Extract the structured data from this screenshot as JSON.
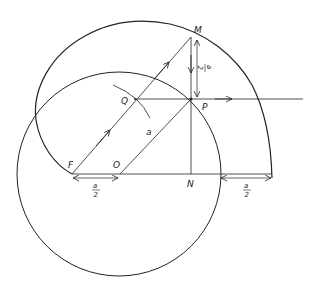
{
  "diagram": {
    "points": {
      "M": "M",
      "P": "P",
      "Q": "Q",
      "F": "F",
      "O": "O",
      "N": "N"
    },
    "labels": {
      "radius": "a",
      "half_num": "a",
      "half_den": "2"
    },
    "colors": {
      "stroke": "#222222",
      "background": "#ffffff"
    }
  }
}
